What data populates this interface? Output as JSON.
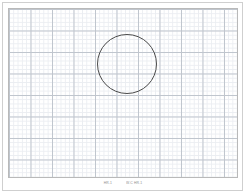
{
  "sheet": {
    "title": "Graph Paper Sheet",
    "background_color": "#ffffff",
    "outer_rule_color": "#cfcfcf",
    "frame_color": "#b9b9b9"
  },
  "grid": {
    "minor_spacing_px": 4.3,
    "major_spacing_px": 21.5,
    "minor_color": "#dfe3ea",
    "major_color": "#9aa3b0",
    "columns_major": 11,
    "rows_major": 8
  },
  "plot": {
    "shape": "circle",
    "stroke_color": "#4a4a4a",
    "stroke_width_px": 1,
    "fill": "none",
    "center_x_px": 127,
    "center_y_px": 64,
    "radius_px": 29.5,
    "diameter_px": 59
  },
  "caption": {
    "left_label": "HR.1",
    "right_label": "W.C HR.1",
    "text_color": "#8d8d8d"
  }
}
